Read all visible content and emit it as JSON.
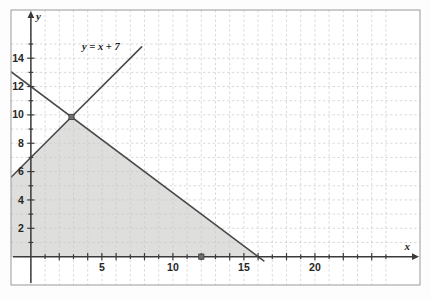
{
  "figure": {
    "frame": {
      "x": 11,
      "y": 10,
      "width": 409,
      "height": 275
    },
    "background_color": "#fdfdfd",
    "frame_color": "#9a9a9a",
    "grid_color": "#c9c9c9",
    "axis_color": "#3a3a3a",
    "line_color": "#4a4a4a",
    "shade_color": "#dededd"
  },
  "axes": {
    "x_axis_label": "x",
    "y_axis_label": "y",
    "x_ticks": [
      1,
      2,
      3,
      4,
      5,
      6,
      7,
      8,
      9,
      10,
      11,
      12,
      13,
      14,
      15,
      16,
      17,
      18,
      19,
      20,
      21,
      22,
      23,
      24,
      25
    ],
    "y_ticks": [
      1,
      2,
      3,
      4,
      5,
      6,
      7,
      8,
      9,
      10,
      11,
      12,
      13,
      14,
      15
    ],
    "x_tick_labels": [
      "5",
      "10",
      "15",
      "20"
    ],
    "x_tick_label_values": [
      5,
      10,
      15,
      20
    ],
    "y_tick_labels": [
      "2",
      "4",
      "6",
      "8",
      "10",
      "12",
      "14"
    ],
    "y_tick_label_values": [
      2,
      4,
      6,
      8,
      10,
      12,
      14
    ]
  },
  "annotations": {
    "equation_label": "y = x + 7"
  },
  "chart_data": {
    "type": "line",
    "title": "",
    "xlabel": "x",
    "ylabel": "y",
    "xlim": [
      -1.4,
      27.4
    ],
    "ylim": [
      -2.0,
      17.4
    ],
    "grid": true,
    "legend": "none",
    "series": [
      {
        "name": "y = x + 7",
        "equation": "y = x + 7",
        "slope": 1,
        "intercept": 7,
        "label_text": "y = x + 7",
        "label_x": 3.6,
        "label_y": 14.6,
        "points": [
          [
            -1.4,
            5.6
          ],
          [
            7.8,
            14.8
          ]
        ]
      },
      {
        "name": "y = 12 - 0.75x",
        "equation": "y = 12 - 0.75x",
        "slope": -0.75,
        "intercept": 12,
        "label_text": "",
        "points": [
          [
            -1.4,
            13.05
          ],
          [
            16.4,
            -0.3
          ]
        ]
      }
    ],
    "markers": [
      {
        "name": "intersection-point",
        "x": 2.86,
        "y": 9.86,
        "style": "filled-square"
      },
      {
        "name": "x-intercept-point",
        "x": 12,
        "y": 0,
        "style": "filled-square"
      }
    ],
    "shaded_region": {
      "description": "Region below y = 12 - 0.75x, above y = x + 7 boundary on the left, above y = 0, left of x = 22.8",
      "fill": "#dededd",
      "x_clip_max": 22.8,
      "y_clip_min": 0
    }
  }
}
